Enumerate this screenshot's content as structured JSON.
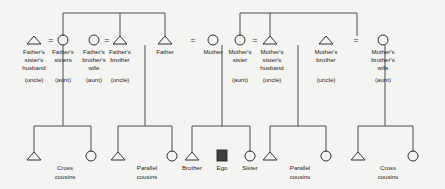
{
  "diagram": {
    "colors": {
      "background": "#f4f4f2",
      "line": "#4a4a4a",
      "symbol_stroke": "#2e2e2e",
      "ego_fill": "#3d3d3d",
      "text": "#1c1c1c"
    },
    "marriage_symbol": "=",
    "generation1": [
      {
        "id": "fathers-sisters-husband",
        "symbol": "triangle",
        "sex": "male",
        "lines": [
          "Father's",
          "sister's",
          "husband",
          "(uncle)"
        ]
      },
      {
        "id": "fathers-sisters",
        "symbol": "circle",
        "sex": "female",
        "lines": [
          "Father's",
          "sisters",
          "",
          "(aunt)"
        ]
      },
      {
        "id": "fathers-brothers-wife",
        "symbol": "circle",
        "sex": "female",
        "lines": [
          "Father's",
          "brother's",
          "wife",
          "(aunt)"
        ]
      },
      {
        "id": "fathers-brother",
        "symbol": "triangle",
        "sex": "male",
        "lines": [
          "Father's",
          "brother",
          "",
          "(uncle)"
        ]
      },
      {
        "id": "father",
        "symbol": "triangle",
        "sex": "male",
        "lines": [
          "Father",
          "",
          "",
          ""
        ]
      },
      {
        "id": "mother",
        "symbol": "circle",
        "sex": "female",
        "lines": [
          "Mother",
          "",
          "",
          ""
        ]
      },
      {
        "id": "mothers-sister",
        "symbol": "circle",
        "sex": "female",
        "lines": [
          "Mother's",
          "sister",
          "",
          "(aunt)"
        ]
      },
      {
        "id": "mothers-sisters-husband",
        "symbol": "triangle",
        "sex": "male",
        "lines": [
          "Mother's",
          "sister's",
          "husband",
          "(uncle)"
        ]
      },
      {
        "id": "mothers-brother",
        "symbol": "triangle",
        "sex": "male",
        "lines": [
          "Mother's",
          "brother",
          "",
          "(uncle)"
        ]
      },
      {
        "id": "mothers-brothers-wife",
        "symbol": "circle",
        "sex": "female",
        "lines": [
          "Mother's",
          "brother's",
          "wife",
          "(aunt)"
        ]
      }
    ],
    "generation2": [
      {
        "id": "cross-cousins-left-male",
        "symbol": "triangle",
        "sex": "male",
        "lines": [
          "",
          ""
        ]
      },
      {
        "id": "cross-cousins-left-label",
        "symbol": "none",
        "lines": [
          "Cross",
          "cousins"
        ]
      },
      {
        "id": "cross-cousins-left-female",
        "symbol": "circle",
        "sex": "female",
        "lines": [
          "",
          ""
        ]
      },
      {
        "id": "parallel-cousins-left-male",
        "symbol": "triangle",
        "sex": "male",
        "lines": [
          "",
          ""
        ]
      },
      {
        "id": "parallel-cousins-left-label",
        "symbol": "none",
        "lines": [
          "Parallel",
          "cousins"
        ]
      },
      {
        "id": "parallel-cousins-left-female",
        "symbol": "circle",
        "sex": "female",
        "lines": [
          "",
          ""
        ]
      },
      {
        "id": "brother",
        "symbol": "triangle",
        "sex": "male",
        "lines": [
          "Brother",
          ""
        ]
      },
      {
        "id": "ego",
        "symbol": "square-filled",
        "sex": "ego",
        "lines": [
          "Ego",
          ""
        ]
      },
      {
        "id": "sister",
        "symbol": "circle",
        "sex": "female",
        "lines": [
          "Sister",
          ""
        ]
      },
      {
        "id": "parallel-cousins-right-male",
        "symbol": "triangle",
        "sex": "male",
        "lines": [
          "",
          ""
        ]
      },
      {
        "id": "parallel-cousins-right-label",
        "symbol": "none",
        "lines": [
          "Parallel",
          "cousins"
        ]
      },
      {
        "id": "parallel-cousins-right-female",
        "symbol": "circle",
        "sex": "female",
        "lines": [
          "",
          ""
        ]
      },
      {
        "id": "cross-cousins-right-male",
        "symbol": "triangle",
        "sex": "male",
        "lines": [
          "",
          ""
        ]
      },
      {
        "id": "cross-cousins-right-label",
        "symbol": "none",
        "lines": [
          "Cross",
          "cousins"
        ]
      },
      {
        "id": "cross-cousins-right-female",
        "symbol": "circle",
        "sex": "female",
        "lines": [
          "",
          ""
        ]
      }
    ],
    "marriages": [
      {
        "id": "marriage-fz-husband",
        "label": "="
      },
      {
        "id": "marriage-fb-wife",
        "label": "="
      },
      {
        "id": "marriage-father-mother",
        "label": "="
      },
      {
        "id": "marriage-mz-husband",
        "label": "="
      },
      {
        "id": "marriage-mb-wife",
        "label": "="
      }
    ]
  }
}
